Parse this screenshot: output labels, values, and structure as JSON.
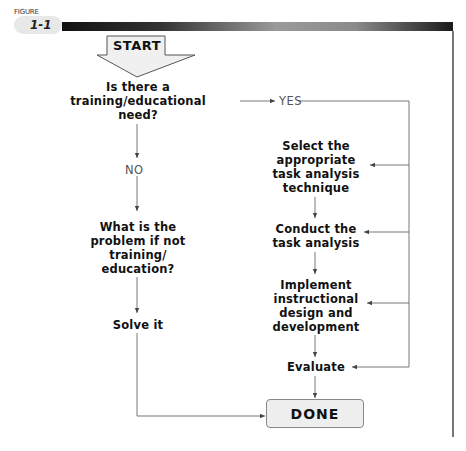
{
  "figure": {
    "label": "FIGURE",
    "number": "1-1"
  },
  "flowchart": {
    "start": "START",
    "decision": "Is there a\ntraining/educational\nneed?",
    "yes_label": "YES",
    "no_label": "NO",
    "no_branch": {
      "question": "What is the\nproblem if not\ntraining/\neducation?",
      "action": "Solve it"
    },
    "yes_branch": {
      "steps": [
        "Select the\nappropriate\ntask analysis\ntechnique",
        "Conduct the\ntask analysis",
        "Implement\ninstructional\ndesign and\ndevelopment",
        "Evaluate"
      ]
    },
    "end": "DONE"
  },
  "colors": {
    "line": "#555555",
    "text": "#111111",
    "label_text": "#555555",
    "box_fill": "#eeeeee"
  }
}
